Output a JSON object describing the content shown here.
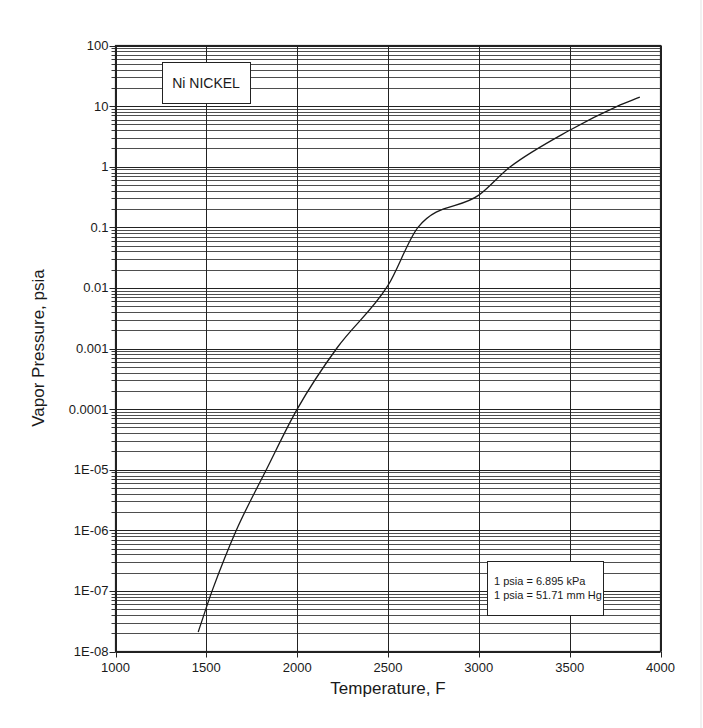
{
  "chart_data": {
    "type": "line",
    "title": "Ni  NICKEL",
    "xlabel": "Temperature, F",
    "ylabel": "Vapor Pressure, psia",
    "xscale": "linear",
    "yscale": "log",
    "xlim": [
      1000,
      4000
    ],
    "ylim": [
      1e-08,
      100
    ],
    "grid": true,
    "x_ticks": [
      1000,
      1500,
      2000,
      2500,
      3000,
      3500,
      4000
    ],
    "x_tick_labels": [
      "1000",
      "1500",
      "2000",
      "2500",
      "3000",
      "3500",
      "4000"
    ],
    "y_ticks": [
      1e-08,
      1e-07,
      1e-06,
      1e-05,
      0.0001,
      0.001,
      0.01,
      0.1,
      1,
      10,
      100
    ],
    "y_tick_labels": [
      "1E-08",
      "1E-07",
      "1E-06",
      "1E-05",
      "0.0001",
      "0.001",
      "0.01",
      "0.1",
      "1",
      "10",
      "100"
    ],
    "annotations": [
      "1 psia = 6.895 kPa",
      "1 psia = 51.71 mm Hg"
    ],
    "series": [
      {
        "name": "Ni NICKEL",
        "x": [
          1455,
          1532,
          1665,
          1830,
          2000,
          2217,
          2500,
          2665,
          3000,
          3173,
          3500,
          3764,
          3886
        ],
        "y": [
          2.1e-08,
          1e-07,
          1e-06,
          1e-05,
          0.0001,
          0.001,
          0.011,
          0.1,
          0.34,
          1,
          4.0,
          10,
          14
        ]
      }
    ]
  },
  "title_box": {
    "label": "Ni  NICKEL"
  },
  "conversion_note": {
    "line1": "1 psia = 6.895 kPa",
    "line2": "1 psia = 51.71 mm Hg"
  },
  "axes": {
    "x_title": "Temperature, F",
    "y_title": "Vapor Pressure, psia"
  }
}
